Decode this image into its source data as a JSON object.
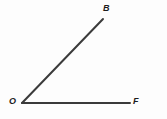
{
  "figure": {
    "type": "geometry-angle-diagram",
    "background_color": "#fdfdfd",
    "stroke_color": "#3b3b3b",
    "label_color": "#1c1c1c",
    "vertex": {
      "name": "O",
      "x": 22,
      "y": 103
    },
    "rays": [
      {
        "name": "ray-OB",
        "from": {
          "x": 22,
          "y": 103
        },
        "to": {
          "x": 103,
          "y": 19
        },
        "endpoint_label": "B",
        "stroke_width": 2
      },
      {
        "name": "ray-OF",
        "from": {
          "x": 22,
          "y": 103
        },
        "to": {
          "x": 130,
          "y": 103
        },
        "endpoint_label": "F",
        "stroke_width": 2
      }
    ],
    "labels": {
      "vertex": "O",
      "upper_ray": "B",
      "horizontal_ray": "F"
    }
  }
}
